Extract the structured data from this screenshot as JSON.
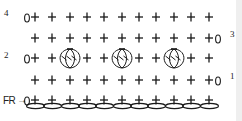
{
  "diagram": {
    "type": "crochet-chart",
    "colors": {
      "ink": "#1a1a1a",
      "background": "#ffffff",
      "edge": "#efefef"
    },
    "columns": 11,
    "column_x": [
      35,
      52,
      70,
      87,
      104,
      122,
      139,
      156,
      174,
      191,
      209
    ],
    "foundation": {
      "label": "FR",
      "arrow": "→",
      "y": 102,
      "chain_count": 11,
      "stitch": "single-crochet"
    },
    "rows": [
      {
        "number": "4",
        "y": 17,
        "turning_chain_side": "left",
        "stitches": [
          "sc",
          "sc",
          "sc",
          "sc",
          "sc",
          "sc",
          "sc",
          "sc",
          "sc",
          "sc",
          "sc"
        ]
      },
      {
        "number": "3",
        "y": 38,
        "turning_chain_side": "right",
        "stitches": [
          "sc",
          "sc",
          "sc",
          "sc",
          "sc",
          "sc",
          "sc",
          "sc",
          "sc",
          "sc",
          "sc"
        ]
      },
      {
        "number": "2",
        "y": 58,
        "turning_chain_side": "left",
        "stitches": [
          "sc",
          "sc",
          "bobble",
          "sc",
          "sc",
          "bobble",
          "sc",
          "sc",
          "bobble",
          "sc",
          "sc"
        ]
      },
      {
        "number": "1",
        "y": 80,
        "turning_chain_side": "right",
        "stitches": [
          "sc",
          "sc",
          "sc",
          "sc",
          "sc",
          "sc",
          "sc",
          "sc",
          "sc",
          "sc",
          "sc"
        ]
      }
    ],
    "legend_symbols": {
      "sc": "+",
      "chain": "oval",
      "turning_chain": "0",
      "bobble": "cluster"
    }
  }
}
